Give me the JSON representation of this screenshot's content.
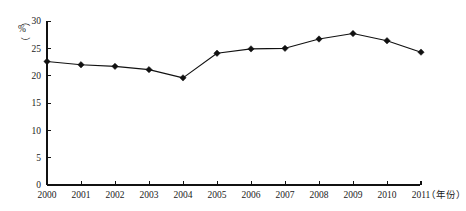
{
  "chart_data": {
    "type": "line",
    "title": "",
    "subtitle": "",
    "xlabel": "（年份）",
    "ylabel": "（%）",
    "ylabel_chars": [
      "（",
      "%",
      "）"
    ],
    "categories": [
      "2000",
      "2001",
      "2002",
      "2003",
      "2004",
      "2005",
      "2006",
      "2007",
      "2008",
      "2009",
      "2010",
      "2011"
    ],
    "values": [
      22.6,
      22.0,
      21.7,
      21.1,
      19.6,
      24.1,
      24.9,
      25.0,
      26.7,
      27.7,
      26.4,
      24.3
    ],
    "series": [
      {
        "name": "比重",
        "values": [
          22.6,
          22.0,
          21.7,
          21.1,
          19.6,
          24.1,
          24.9,
          25.0,
          26.7,
          27.7,
          26.4,
          24.3
        ]
      }
    ],
    "ylim": [
      0,
      30
    ],
    "yticks": [
      0,
      5,
      10,
      15,
      20,
      25,
      30
    ],
    "ytick_labels": [
      "0",
      "5",
      "10",
      "15",
      "20",
      "25",
      "30"
    ],
    "xtick_labels": [
      "2000",
      "2001",
      "2002",
      "2003",
      "2004",
      "2005",
      "2006",
      "2007",
      "2008",
      "2009",
      "2010",
      "2011"
    ],
    "grid": false,
    "legend": null,
    "legend_position": "none",
    "marker": "diamond",
    "line_color": "#111111",
    "marker_color": "#111111",
    "axis_color": "#111111",
    "background_color": "#ffffff",
    "annotations": []
  }
}
